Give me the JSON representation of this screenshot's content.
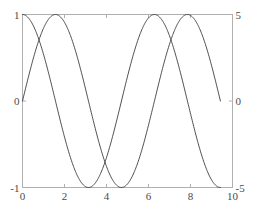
{
  "chart_data": {
    "type": "line",
    "title": "",
    "xlabel": "",
    "ylabel": "",
    "y2label": "",
    "xlim": [
      0,
      10
    ],
    "ylim": [
      -1,
      1
    ],
    "y2lim": [
      -5,
      5
    ],
    "grid": false,
    "legend": null,
    "x_ticks": [
      {
        "value": 0,
        "label": "0"
      },
      {
        "value": 2,
        "label": "2"
      },
      {
        "value": 4,
        "label": "4"
      },
      {
        "value": 6,
        "label": "6"
      },
      {
        "value": 8,
        "label": "8"
      },
      {
        "value": 10,
        "label": "10"
      }
    ],
    "y_ticks_left": [
      {
        "value": -1,
        "label": "-1"
      },
      {
        "value": 0,
        "label": "0"
      },
      {
        "value": 1,
        "label": "1"
      }
    ],
    "y_ticks_right": [
      {
        "value": -5,
        "label": "-5"
      },
      {
        "value": 0,
        "label": "0"
      },
      {
        "value": 5,
        "label": "5"
      }
    ],
    "series": [
      {
        "name": "sin(x)",
        "axis": "left",
        "color": "#3a3a3a",
        "x_start": 0,
        "x_end": 9.4248,
        "function": "sin",
        "amplitude": 1,
        "phase": 0,
        "points_x": [
          0,
          0.5,
          1.0,
          1.5708,
          2.0,
          2.5,
          3.0,
          3.1416,
          3.5,
          4.0,
          4.7124,
          5.0,
          5.5,
          6.0,
          6.2832,
          6.5,
          7.0,
          7.5,
          7.854,
          8.0,
          8.5,
          9.0,
          9.4248
        ],
        "points_y": [
          0,
          0.4794,
          0.8415,
          1.0,
          0.9093,
          0.5985,
          0.1411,
          0,
          -0.3508,
          -0.7568,
          -1.0,
          -0.9589,
          -0.7055,
          -0.2794,
          0,
          0.2151,
          0.657,
          0.938,
          1.0,
          0.9894,
          0.7985,
          0.4121,
          0
        ]
      },
      {
        "name": "cos(x)",
        "axis": "right",
        "color": "#3a3a3a",
        "x_start": 0,
        "x_end": 9.4248,
        "function": "cos",
        "amplitude": 5,
        "phase": 0,
        "points_x": [
          0,
          0.5,
          1.0,
          1.5708,
          2.0,
          2.5,
          3.0,
          3.1416,
          3.5,
          4.0,
          4.7124,
          5.0,
          5.5,
          6.0,
          6.2832,
          6.5,
          7.0,
          7.5,
          7.854,
          8.0,
          8.5,
          9.0,
          9.4248
        ],
        "points_y": [
          5.0,
          4.388,
          2.701,
          0,
          -2.081,
          -4.005,
          -4.95,
          -5.0,
          -4.683,
          -3.268,
          0,
          1.418,
          3.541,
          4.801,
          5.0,
          4.946,
          3.77,
          1.766,
          0,
          -0.727,
          -3.296,
          -4.554,
          -5.0
        ]
      }
    ]
  },
  "axes": {
    "frame_color": "#b0b0b0",
    "tick_color": "#b0b0b0",
    "background": "#ffffff"
  }
}
